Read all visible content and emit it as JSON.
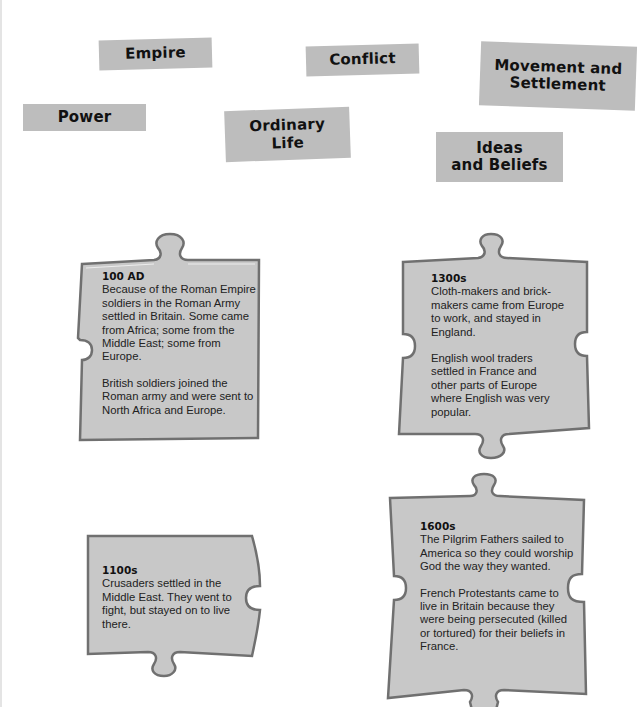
{
  "labels": [
    {
      "id": "empire",
      "text": "Empire"
    },
    {
      "id": "conflict",
      "text": "Conflict"
    },
    {
      "id": "movement",
      "text": "Movement and\nSettlement"
    },
    {
      "id": "power",
      "text": "Power"
    },
    {
      "id": "ordinary",
      "text": "Ordinary\nLife"
    },
    {
      "id": "ideas",
      "text": "Ideas\nand Beliefs"
    }
  ],
  "pieces": [
    {
      "year": "100 AD",
      "paragraphs": [
        "Because of the Roman Empire\nsoldiers in the Roman Army\nsettled in Britain. Some came\nfrom Africa; some from the\nMiddle East; some from\nEurope.",
        "British soldiers joined the\nRoman army and were sent to\nNorth Africa and Europe."
      ]
    },
    {
      "year": "1300s",
      "paragraphs": [
        "Cloth-makers and brick-\nmakers came from Europe\nto work, and stayed in\nEngland.",
        "English wool traders\nsettled in France and\nother parts of Europe\nwhere English was very\npopular."
      ]
    },
    {
      "year": "1100s",
      "paragraphs": [
        "Crusaders settled in the\nMiddle East. They went to\nfight, but stayed on to live\nthere."
      ]
    },
    {
      "year": "1600s",
      "paragraphs": [
        "The Pilgrim Fathers sailed to\nAmerica so they could worship\nGod the way they wanted.",
        "French Protestants came to\nlive in Britain because they\nwere being persecuted (killed\nor tortured) for their beliefs in\nFrance."
      ]
    }
  ],
  "colors": {
    "label_bg": "#bdbdbd",
    "piece_fill": "#c9c9c9",
    "piece_border": "#6e6e6e",
    "text": "#222222"
  }
}
